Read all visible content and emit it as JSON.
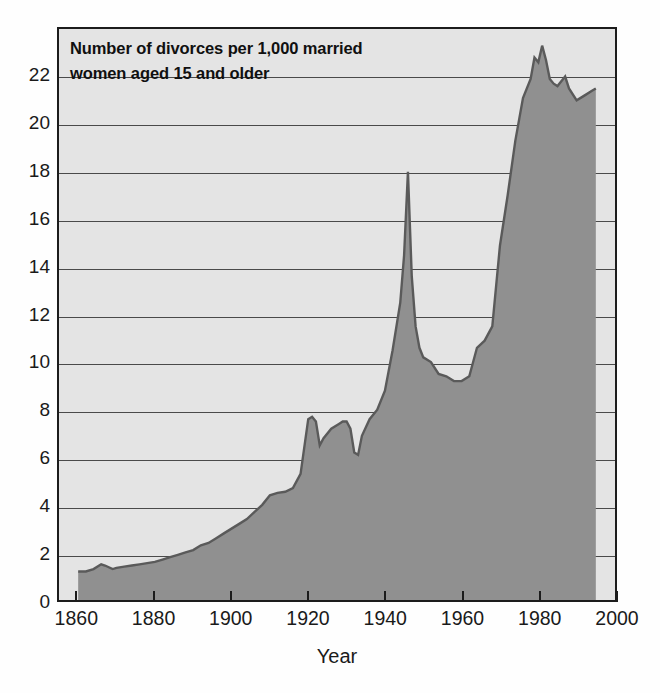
{
  "chart_data": {
    "type": "area",
    "title": "Number of divorces per 1,000 married women aged 15 and older",
    "title_lines": [
      "Number of divorces per 1,000 married",
      "women aged 15 and older"
    ],
    "xlabel": "Year",
    "ylabel": "",
    "xlim": [
      1855,
      2000
    ],
    "ylim": [
      0,
      24
    ],
    "xticks": [
      1860,
      1880,
      1900,
      1920,
      1940,
      1960,
      1980,
      2000
    ],
    "xtick_labels": [
      "1860",
      "1880",
      "1900",
      "1920",
      "1940",
      "1960",
      "1980",
      "2000"
    ],
    "yticks": [
      0,
      2,
      4,
      6,
      8,
      10,
      12,
      14,
      16,
      18,
      20,
      22
    ],
    "ytick_labels": [
      "0",
      "2",
      "4",
      "6",
      "8",
      "10",
      "12",
      "14",
      "16",
      "18",
      "20",
      "22"
    ],
    "grid": "horizontal",
    "legend": "none",
    "colors": {
      "fill": "#909090",
      "line": "#5a5a5a",
      "plot_background": "#e4e4e4",
      "frame": "#1c1c1c",
      "gridline": "#4a4a4a",
      "text": "#1a1a1a"
    },
    "x": [
      1860,
      1862,
      1864,
      1866,
      1867,
      1869,
      1870,
      1872,
      1874,
      1876,
      1878,
      1880,
      1882,
      1884,
      1886,
      1888,
      1890,
      1892,
      1894,
      1896,
      1898,
      1900,
      1902,
      1904,
      1906,
      1908,
      1910,
      1912,
      1914,
      1916,
      1918,
      1920,
      1921,
      1922,
      1923,
      1924,
      1926,
      1928,
      1929,
      1930,
      1931,
      1932,
      1933,
      1934,
      1936,
      1938,
      1940,
      1942,
      1944,
      1945,
      1946,
      1947,
      1948,
      1949,
      1950,
      1952,
      1954,
      1956,
      1958,
      1960,
      1962,
      1964,
      1966,
      1968,
      1970,
      1972,
      1974,
      1976,
      1978,
      1979,
      1980,
      1981,
      1982,
      1983,
      1984,
      1985,
      1986,
      1987,
      1988,
      1990,
      1992,
      1994,
      1995
    ],
    "y": [
      1.2,
      1.2,
      1.3,
      1.5,
      1.45,
      1.3,
      1.35,
      1.4,
      1.45,
      1.5,
      1.55,
      1.6,
      1.7,
      1.8,
      1.9,
      2.0,
      2.1,
      2.3,
      2.4,
      2.6,
      2.8,
      3.0,
      3.2,
      3.4,
      3.7,
      4.0,
      4.4,
      4.5,
      4.55,
      4.7,
      5.3,
      7.6,
      7.7,
      7.5,
      6.5,
      6.8,
      7.2,
      7.4,
      7.5,
      7.5,
      7.2,
      6.2,
      6.1,
      6.9,
      7.6,
      8.0,
      8.8,
      10.5,
      12.5,
      14.5,
      18.0,
      13.6,
      11.5,
      10.6,
      10.2,
      10.0,
      9.5,
      9.4,
      9.2,
      9.2,
      9.4,
      10.6,
      10.9,
      11.5,
      14.9,
      17.0,
      19.3,
      21.1,
      21.9,
      22.8,
      22.6,
      23.3,
      22.7,
      21.9,
      21.7,
      21.6,
      21.8,
      22.0,
      21.5,
      21.0,
      21.2,
      21.4,
      21.5
    ]
  }
}
